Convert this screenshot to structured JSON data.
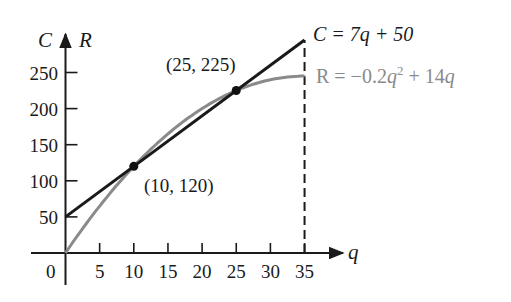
{
  "chart_data": {
    "type": "line",
    "title": "",
    "xlabel": "q",
    "ylabel": "C  R",
    "xlim": [
      0,
      35
    ],
    "ylim": [
      0,
      280
    ],
    "x_ticks": [
      0,
      5,
      10,
      15,
      20,
      25,
      30,
      35
    ],
    "y_ticks": [
      50,
      100,
      150,
      200,
      250
    ],
    "grid": false,
    "series": [
      {
        "name": "C = 7q + 50",
        "kind": "cost",
        "color": "#1a1a1a",
        "equation": "C = 7q + 50",
        "x": [
          0,
          5,
          10,
          15,
          20,
          25,
          30,
          35
        ],
        "values": [
          50,
          85,
          120,
          155,
          190,
          225,
          260,
          295
        ]
      },
      {
        "name": "R = -0.2q^2 + 14q",
        "kind": "revenue",
        "color": "#8a8a8a",
        "equation": "R = −0.2q² + 14q",
        "x": [
          0,
          5,
          10,
          15,
          20,
          25,
          30,
          35
        ],
        "values": [
          0,
          65,
          120,
          165,
          200,
          225,
          240,
          245
        ]
      }
    ],
    "points": [
      {
        "x": 10,
        "y": 120,
        "label": "(10, 120)"
      },
      {
        "x": 25,
        "y": 225,
        "label": "(25, 225)"
      }
    ],
    "annotations": [
      {
        "type": "vertical-dashed-line",
        "x": 35,
        "from": 0,
        "to": 295
      }
    ]
  },
  "labels": {
    "y_axis_c": "C",
    "y_axis_r": "R",
    "x_axis": "q",
    "origin": "0",
    "eq_c": "C = 7q + 50",
    "eq_r_prefix": "R = −0.2",
    "eq_r_q": "q",
    "eq_r_sup": "2",
    "eq_r_suffix": " + 14",
    "eq_r_q2": "q",
    "point1": "(10, 120)",
    "point2": "(25, 225)",
    "x_ticks": [
      "5",
      "10",
      "15",
      "20",
      "25",
      "30",
      "35"
    ],
    "y_ticks": [
      "50",
      "100",
      "150",
      "200",
      "250"
    ]
  }
}
